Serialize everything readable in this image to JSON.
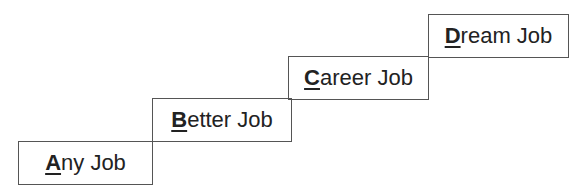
{
  "diagram": {
    "type": "staircase",
    "steps": [
      {
        "first": "A",
        "rest": "ny Job",
        "label": "Any Job"
      },
      {
        "first": "B",
        "rest": "etter Job",
        "label": "Better Job"
      },
      {
        "first": "C",
        "rest": "areer Job",
        "label": "Career Job"
      },
      {
        "first": "D",
        "rest": "ream Job",
        "label": "Dream Job"
      }
    ],
    "colors": {
      "border": "#555555",
      "text": "#222222",
      "background": "#ffffff"
    }
  }
}
